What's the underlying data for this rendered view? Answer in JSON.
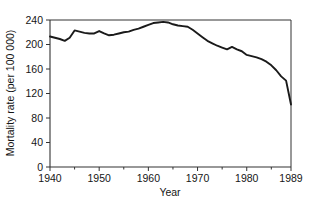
{
  "chart_data": {
    "type": "line",
    "title": "",
    "xlabel": "Year",
    "ylabel": "Mortality rate (per 100 000)",
    "xlim": [
      1940,
      1989
    ],
    "ylim": [
      0,
      240
    ],
    "grid": false,
    "legend": null,
    "x_ticks": [
      1940,
      1950,
      1960,
      1970,
      1980,
      1989
    ],
    "x_tick_labels": [
      "1940",
      "1950",
      "1960",
      "1970",
      "1980",
      "1989"
    ],
    "x_minor_ticks": [
      1945,
      1955,
      1965,
      1975,
      1985
    ],
    "y_ticks": [
      0,
      40,
      80,
      120,
      160,
      200,
      240
    ],
    "y_tick_labels": [
      "0",
      "40",
      "80",
      "120",
      "160",
      "200",
      "240"
    ],
    "line_color": "#1a1a1a",
    "line_width": 1.9,
    "series": [
      {
        "name": "Mortality rate",
        "x": [
          1940,
          1941,
          1942,
          1943,
          1944,
          1945,
          1946,
          1947,
          1948,
          1949,
          1950,
          1951,
          1952,
          1953,
          1954,
          1955,
          1956,
          1957,
          1958,
          1959,
          1960,
          1961,
          1962,
          1963,
          1964,
          1965,
          1966,
          1967,
          1968,
          1969,
          1970,
          1971,
          1972,
          1973,
          1974,
          1975,
          1976,
          1977,
          1978,
          1979,
          1980,
          1981,
          1982,
          1983,
          1984,
          1985,
          1986,
          1987,
          1988,
          1989
        ],
        "values": [
          213,
          211,
          209,
          206,
          211,
          223,
          221,
          219,
          218,
          218,
          222,
          218,
          215,
          216,
          218,
          220,
          221,
          224,
          226,
          229,
          232,
          235,
          236,
          237,
          236,
          233,
          231,
          230,
          229,
          224,
          218,
          212,
          206,
          202,
          198,
          195,
          192,
          196,
          192,
          189,
          183,
          181,
          179,
          176,
          172,
          166,
          158,
          148,
          141,
          102
        ]
      }
    ]
  },
  "axes": {
    "ylabel": "Mortality rate (per 100 000)",
    "xlabel": "Year"
  }
}
